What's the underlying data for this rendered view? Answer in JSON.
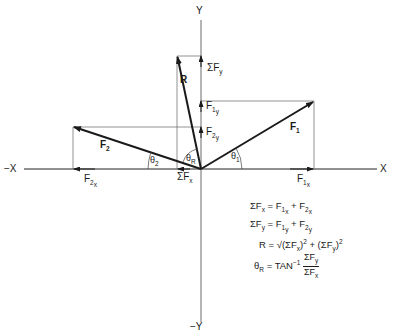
{
  "axes": {
    "x_pos": "X",
    "x_neg": "−X",
    "y_pos": "Y",
    "y_neg": "−Y"
  },
  "vectors": {
    "F1": {
      "label": "F",
      "sub": "1"
    },
    "F2": {
      "label": "F",
      "sub": "2"
    },
    "R": {
      "label": "R"
    }
  },
  "components": {
    "F1x": {
      "label": "F",
      "sub": "1",
      "subsub": "x"
    },
    "F1y": {
      "label": "F",
      "sub": "1",
      "subsub": "y"
    },
    "F2x": {
      "label": "F",
      "sub": "2",
      "subsub": "x"
    },
    "F2y": {
      "label": "F",
      "sub": "2",
      "subsub": "y"
    },
    "SumFx": {
      "label": "ΣF",
      "sub": "x"
    },
    "SumFy": {
      "label": "ΣF",
      "sub": "y"
    }
  },
  "angles": {
    "theta1": {
      "label": "θ",
      "sub": "1"
    },
    "theta2": {
      "label": "θ",
      "sub": "2"
    },
    "thetaR": {
      "label": "θ",
      "sub": "R"
    }
  },
  "equations": [
    {
      "lhs": "ΣF",
      "lhs_sub": "x",
      "eq": " = ",
      "t1": "F",
      "t1_sub": "1",
      "t1_subsub": "x",
      "plus": " + ",
      "t2": "F",
      "t2_sub": "2",
      "t2_subsub": "x"
    },
    {
      "lhs": "ΣF",
      "lhs_sub": "y",
      "eq": " = ",
      "t1": "F",
      "t1_sub": "1",
      "t1_subsub": "y",
      "plus": " + ",
      "t2": "F",
      "t2_sub": "2",
      "t2_subsub": "y"
    },
    {
      "text": "R = √(ΣF",
      "a_sub": "x",
      "mid": ")",
      "sq": "2",
      "plus": " + (ΣF",
      "b_sub": "y",
      "end": ")",
      "sq2": "2"
    },
    {
      "lhs": "θ",
      "lhs_sub": "R",
      "eq": " = TAN",
      "exp": "−1",
      "num": "ΣF",
      "num_sub": "y",
      "den": "ΣF",
      "den_sub": "x"
    }
  ],
  "colors": {
    "line": "#1a1a1a",
    "thin": "#555555"
  }
}
